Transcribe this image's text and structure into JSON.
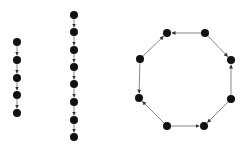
{
  "diagram": {
    "type": "directed-graphs",
    "colors": {
      "node": "#111111",
      "edge": "#888888",
      "background": "#ffffff"
    },
    "node_radius": 4,
    "graphs": [
      {
        "name": "path-5",
        "nodes": [
          [
            17,
            42
          ],
          [
            17,
            60
          ],
          [
            17,
            78
          ],
          [
            17,
            95
          ],
          [
            17,
            113
          ]
        ],
        "edges": [
          [
            0,
            1
          ],
          [
            1,
            2
          ],
          [
            2,
            3
          ],
          [
            3,
            4
          ]
        ]
      },
      {
        "name": "path-8",
        "nodes": [
          [
            74,
            15
          ],
          [
            74,
            32
          ],
          [
            74,
            50
          ],
          [
            74,
            67
          ],
          [
            74,
            84
          ],
          [
            74,
            102
          ],
          [
            74,
            120
          ],
          [
            74,
            137
          ]
        ],
        "edges": [
          [
            0,
            1
          ],
          [
            1,
            2
          ],
          [
            2,
            3
          ],
          [
            3,
            4
          ],
          [
            4,
            5
          ],
          [
            5,
            6
          ],
          [
            6,
            7
          ]
        ]
      },
      {
        "name": "cycle-8",
        "nodes": [
          [
            167,
            33
          ],
          [
            205,
            33
          ],
          [
            231,
            60
          ],
          [
            231,
            99
          ],
          [
            204,
            126
          ],
          [
            167,
            126
          ],
          [
            139,
            98
          ],
          [
            140,
            59
          ]
        ],
        "edges": [
          [
            1,
            0
          ],
          [
            7,
            0
          ],
          [
            1,
            2
          ],
          [
            3,
            2
          ],
          [
            7,
            6
          ],
          [
            5,
            6
          ],
          [
            5,
            4
          ],
          [
            3,
            4
          ]
        ]
      }
    ]
  }
}
